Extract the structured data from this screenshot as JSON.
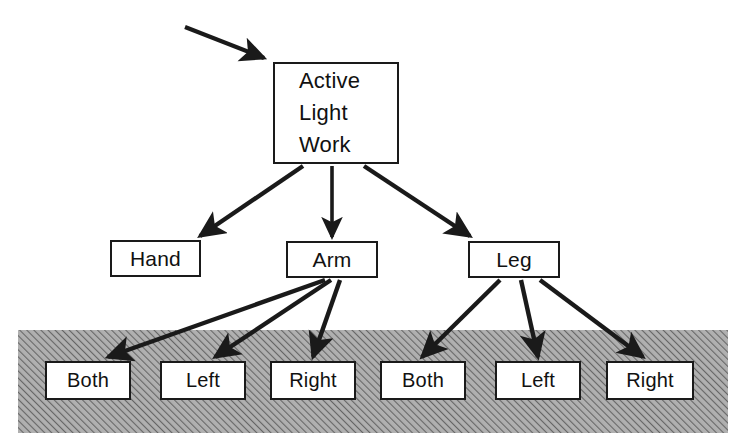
{
  "diagram": {
    "type": "tree-diagram",
    "colors": {
      "stroke": "#1a1a1a",
      "box_fill": "#ffffff",
      "background": "#ffffff",
      "shaded_band": "#a8a8a8",
      "hatch_line": "#6e6e6e"
    },
    "root": {
      "id": "active-light-work",
      "lines": [
        "Active",
        "Light",
        "Work"
      ]
    },
    "level2": [
      {
        "id": "hand",
        "label": "Hand"
      },
      {
        "id": "arm",
        "label": "Arm"
      },
      {
        "id": "leg",
        "label": "Leg"
      }
    ],
    "level3_arm": [
      {
        "id": "arm-both",
        "label": "Both"
      },
      {
        "id": "arm-left",
        "label": "Left"
      },
      {
        "id": "arm-right",
        "label": "Right"
      }
    ],
    "level3_leg": [
      {
        "id": "leg-both",
        "label": "Both"
      },
      {
        "id": "leg-left",
        "label": "Left"
      },
      {
        "id": "leg-right",
        "label": "Right"
      }
    ],
    "shaded_region": {
      "label": "hatched-band",
      "x": 18,
      "y": 330,
      "width": 710,
      "height": 103
    },
    "edges": [
      {
        "from": "external",
        "to": "active-light-work"
      },
      {
        "from": "active-light-work",
        "to": "hand"
      },
      {
        "from": "active-light-work",
        "to": "arm"
      },
      {
        "from": "active-light-work",
        "to": "leg"
      },
      {
        "from": "arm",
        "to": "arm-both"
      },
      {
        "from": "arm",
        "to": "arm-left"
      },
      {
        "from": "arm",
        "to": "arm-right"
      },
      {
        "from": "leg",
        "to": "leg-both"
      },
      {
        "from": "leg",
        "to": "leg-left"
      },
      {
        "from": "leg",
        "to": "leg-right"
      }
    ]
  }
}
